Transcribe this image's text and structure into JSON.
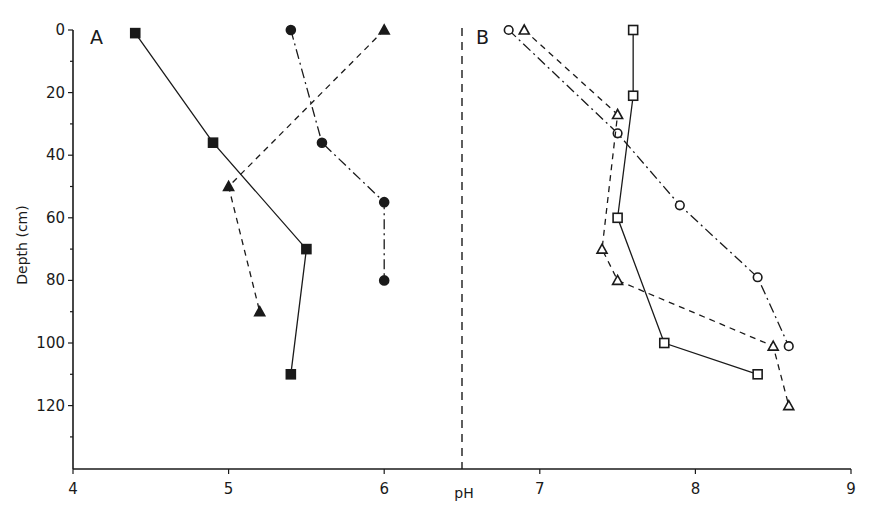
{
  "chart_data": {
    "type": "line",
    "title": "",
    "xlabel": "pH",
    "ylabel": "Depth (cm)",
    "xlim": [
      4,
      9
    ],
    "ylim": [
      140,
      0
    ],
    "y_inverted": true,
    "grid": false,
    "legend": null,
    "x_ticks": [
      "4",
      "5",
      "6",
      "7",
      "8",
      "9"
    ],
    "y_ticks": [
      "0",
      "20",
      "40",
      "60",
      "80",
      "100",
      "120"
    ],
    "divider": {
      "x": 6.5,
      "style": "dashed"
    },
    "panels": [
      {
        "label": "A",
        "series": [
          {
            "name": "filled-square",
            "marker": "square-filled",
            "line": "solid",
            "points": [
              {
                "ph": 4.4,
                "depth": 1
              },
              {
                "ph": 4.9,
                "depth": 36
              },
              {
                "ph": 5.5,
                "depth": 70
              },
              {
                "ph": 5.4,
                "depth": 110
              }
            ]
          },
          {
            "name": "filled-circle",
            "marker": "circle-filled",
            "line": "dashdot",
            "points": [
              {
                "ph": 5.4,
                "depth": 0
              },
              {
                "ph": 5.6,
                "depth": 36
              },
              {
                "ph": 6.0,
                "depth": 55
              },
              {
                "ph": 6.0,
                "depth": 80
              }
            ]
          },
          {
            "name": "filled-triangle",
            "marker": "triangle-filled",
            "line": "dashed",
            "points": [
              {
                "ph": 6.0,
                "depth": 0
              },
              {
                "ph": 5.0,
                "depth": 50
              },
              {
                "ph": 5.2,
                "depth": 90
              }
            ]
          }
        ]
      },
      {
        "label": "B",
        "series": [
          {
            "name": "open-square",
            "marker": "square-open",
            "line": "solid",
            "points": [
              {
                "ph": 7.6,
                "depth": 0
              },
              {
                "ph": 7.6,
                "depth": 21
              },
              {
                "ph": 7.5,
                "depth": 60
              },
              {
                "ph": 7.8,
                "depth": 100
              },
              {
                "ph": 8.4,
                "depth": 110
              }
            ]
          },
          {
            "name": "open-circle",
            "marker": "circle-open",
            "line": "dashdot",
            "points": [
              {
                "ph": 6.8,
                "depth": 0
              },
              {
                "ph": 7.5,
                "depth": 33
              },
              {
                "ph": 7.9,
                "depth": 56
              },
              {
                "ph": 8.4,
                "depth": 79
              },
              {
                "ph": 8.6,
                "depth": 101
              }
            ]
          },
          {
            "name": "open-triangle",
            "marker": "triangle-open",
            "line": "dashed",
            "points": [
              {
                "ph": 6.9,
                "depth": 0
              },
              {
                "ph": 7.5,
                "depth": 27
              },
              {
                "ph": 7.4,
                "depth": 70
              },
              {
                "ph": 7.5,
                "depth": 80
              },
              {
                "ph": 8.5,
                "depth": 101
              },
              {
                "ph": 8.6,
                "depth": 120
              }
            ]
          }
        ]
      }
    ]
  },
  "labels": {
    "panel_a": "A",
    "panel_b": "B",
    "x_axis_title": "pH",
    "y_axis_title": "Depth (cm)"
  },
  "style": {
    "ink": "#1a1a1a",
    "background": "#ffffff"
  }
}
